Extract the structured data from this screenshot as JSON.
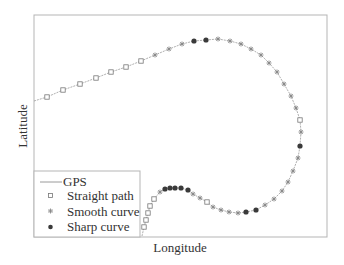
{
  "chart_data": {
    "type": "scatter",
    "title": "",
    "xlabel": "Longitude",
    "ylabel": "Latitude",
    "grid": false,
    "ticks": "none",
    "legend_position": "lower-left",
    "coordinate_space": "pixel positions within 344x265 figure (no numeric axis ticks shown)",
    "frame": {
      "x0": 34,
      "y0": 15,
      "x1": 327,
      "y1": 237
    },
    "series": [
      {
        "name": "GPS",
        "style": "line",
        "color": "#9a9a9a",
        "points": [
          [
            34,
            101
          ],
          [
            47,
            97
          ],
          [
            63,
            90
          ],
          [
            80,
            84
          ],
          [
            96,
            78
          ],
          [
            111,
            72
          ],
          [
            126,
            67
          ],
          [
            141,
            61
          ],
          [
            155,
            55
          ],
          [
            169,
            49
          ],
          [
            182,
            44
          ],
          [
            194,
            41
          ],
          [
            206,
            40
          ],
          [
            218,
            39
          ],
          [
            230,
            41
          ],
          [
            241,
            44
          ],
          [
            251,
            49
          ],
          [
            261,
            55
          ],
          [
            269,
            63
          ],
          [
            277,
            72
          ],
          [
            284,
            84
          ],
          [
            291,
            96
          ],
          [
            296,
            108
          ],
          [
            300,
            120
          ],
          [
            301,
            132
          ],
          [
            300,
            146
          ],
          [
            298,
            158
          ],
          [
            293,
            171
          ],
          [
            288,
            182
          ],
          [
            282,
            191
          ],
          [
            274,
            199
          ],
          [
            265,
            205
          ],
          [
            256,
            210
          ],
          [
            246,
            212
          ],
          [
            238,
            213
          ],
          [
            229,
            212
          ],
          [
            221,
            210
          ],
          [
            213,
            207
          ],
          [
            207,
            202
          ],
          [
            200,
            198
          ],
          [
            193,
            194
          ],
          [
            188,
            190
          ],
          [
            181,
            188
          ],
          [
            175,
            188
          ],
          [
            170,
            188
          ],
          [
            165,
            189
          ],
          [
            160,
            192
          ],
          [
            154,
            199
          ],
          [
            150,
            206
          ],
          [
            148,
            213
          ],
          [
            146,
            220
          ],
          [
            144,
            227
          ],
          [
            142,
            236
          ]
        ]
      },
      {
        "name": "Straight path",
        "style": "open-square",
        "color": "#777777",
        "points": [
          [
            47,
            97
          ],
          [
            63,
            90
          ],
          [
            80,
            84
          ],
          [
            96,
            78
          ],
          [
            111,
            72
          ],
          [
            126,
            67
          ],
          [
            141,
            61
          ],
          [
            300,
            120
          ],
          [
            207,
            202
          ],
          [
            154,
            199
          ],
          [
            150,
            206
          ],
          [
            148,
            213
          ],
          [
            146,
            220
          ],
          [
            144,
            227
          ]
        ]
      },
      {
        "name": "Smooth curve",
        "style": "asterisk",
        "color": "#888888",
        "points": [
          [
            155,
            55
          ],
          [
            169,
            49
          ],
          [
            182,
            44
          ],
          [
            218,
            39
          ],
          [
            230,
            41
          ],
          [
            241,
            44
          ],
          [
            251,
            49
          ],
          [
            261,
            55
          ],
          [
            269,
            63
          ],
          [
            277,
            72
          ],
          [
            284,
            84
          ],
          [
            291,
            96
          ],
          [
            296,
            108
          ],
          [
            301,
            132
          ],
          [
            298,
            158
          ],
          [
            293,
            171
          ],
          [
            288,
            182
          ],
          [
            282,
            191
          ],
          [
            274,
            199
          ],
          [
            265,
            205
          ],
          [
            238,
            213
          ],
          [
            229,
            212
          ],
          [
            221,
            210
          ],
          [
            213,
            207
          ],
          [
            200,
            198
          ],
          [
            193,
            194
          ],
          [
            160,
            192
          ]
        ]
      },
      {
        "name": "Sharp curve",
        "style": "filled-circle",
        "color": "#3a3a3a",
        "points": [
          [
            194,
            41
          ],
          [
            206,
            40
          ],
          [
            300,
            146
          ],
          [
            256,
            210
          ],
          [
            246,
            212
          ],
          [
            188,
            190
          ],
          [
            181,
            188
          ],
          [
            175,
            188
          ],
          [
            170,
            188
          ],
          [
            165,
            189
          ]
        ]
      }
    ]
  },
  "legend": {
    "items": [
      {
        "label": "GPS",
        "symbol": "line"
      },
      {
        "label": "Straight path",
        "symbol": "open-square"
      },
      {
        "label": "Smooth curve",
        "symbol": "asterisk"
      },
      {
        "label": "Sharp curve",
        "symbol": "filled-circle"
      }
    ]
  },
  "axes": {
    "x_label": "Longitude",
    "y_label": "Latitude"
  }
}
